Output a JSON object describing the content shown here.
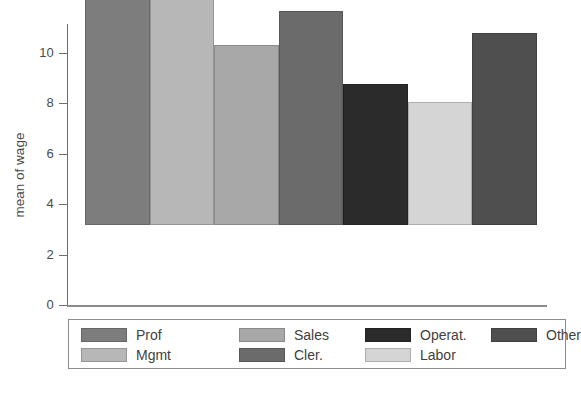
{
  "chart_data": {
    "type": "bar",
    "title": "",
    "xlabel": "",
    "ylabel": "mean of wage",
    "categories": [
      "Prof",
      "Mgmt",
      "Sales",
      "Cler.",
      "Operat.",
      "Labor",
      "Other"
    ],
    "values": [
      10.75,
      10.9,
      7.15,
      8.5,
      5.6,
      4.9,
      7.6
    ],
    "ylim": [
      0,
      11.3
    ],
    "yticks": [
      0,
      2,
      4,
      6,
      8,
      10
    ],
    "ytick_labels": [
      "0",
      "2",
      "4",
      "6",
      "8",
      "10"
    ],
    "grid": false,
    "legend_position": "bottom",
    "bar_colors": [
      "#7d7d7d",
      "#b7b7b7",
      "#a8a8a8",
      "#6b6b6b",
      "#2b2b2b",
      "#d5d5d5",
      "#4f4f4f"
    ],
    "series": [
      {
        "name": "mean of wage",
        "values": [
          10.75,
          10.9,
          7.15,
          8.5,
          5.6,
          4.9,
          7.6
        ]
      }
    ]
  },
  "legend": {
    "entries": [
      {
        "label": "Prof",
        "color": "#7d7d7d"
      },
      {
        "label": "Mgmt",
        "color": "#b7b7b7"
      },
      {
        "label": "Sales",
        "color": "#a8a8a8"
      },
      {
        "label": "Cler.",
        "color": "#6b6b6b"
      },
      {
        "label": "Operat.",
        "color": "#2b2b2b"
      },
      {
        "label": "Labor",
        "color": "#d5d5d5"
      },
      {
        "label": "Other",
        "color": "#4f4f4f"
      }
    ]
  },
  "axis": {
    "y_title": "mean of wage",
    "y_ticks": [
      "0",
      "2",
      "4",
      "6",
      "8",
      "10"
    ]
  }
}
